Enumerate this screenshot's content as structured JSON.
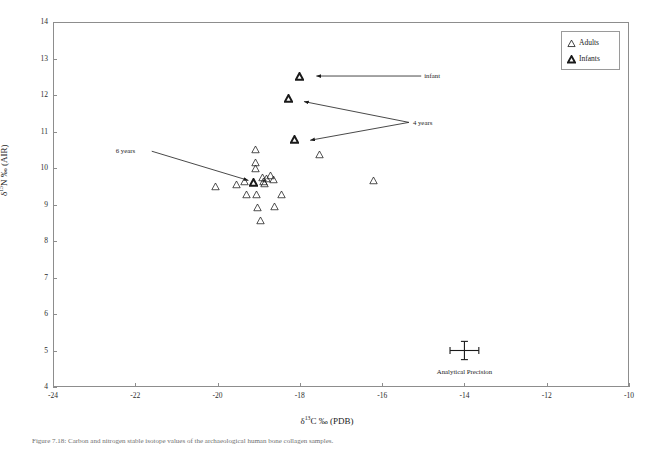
{
  "figure": {
    "caption": "Figure 7.18:  Carbon and nitrogen stable isotope values of the archaeological human bone collagen samples."
  },
  "legend": {
    "position": "top-right",
    "items": [
      {
        "label": "Adults",
        "marker": "open-triangle"
      },
      {
        "label": "Infants",
        "marker": "bold-triangle"
      }
    ]
  },
  "annotations": [
    {
      "id": "infant",
      "label": "infant"
    },
    {
      "id": "four-years",
      "label": "4 years"
    },
    {
      "id": "six-years",
      "label": "6 years"
    },
    {
      "id": "analytical-precision",
      "label": "Analytical Precision"
    }
  ],
  "chart_data": {
    "type": "scatter",
    "title": "",
    "xlabel": "δ¹³C ‰ (PDB)",
    "ylabel": "δ¹⁵N ‰ (AIR)",
    "xlim": [
      -24,
      -10
    ],
    "ylim": [
      4,
      14
    ],
    "xticks": [
      -24,
      -22,
      -20,
      -18,
      -16,
      -14,
      -12,
      -10
    ],
    "yticks": [
      4,
      5,
      6,
      7,
      8,
      9,
      10,
      11,
      12,
      13,
      14
    ],
    "grid": false,
    "series": [
      {
        "name": "Adults",
        "marker": "open-triangle",
        "points": [
          [
            -20.05,
            9.5
          ],
          [
            -19.55,
            9.55
          ],
          [
            -19.3,
            9.28
          ],
          [
            -19.08,
            10.52
          ],
          [
            -19.08,
            10.15
          ],
          [
            -19.08,
            9.98
          ],
          [
            -19.05,
            9.28
          ],
          [
            -19.02,
            8.92
          ],
          [
            -18.95,
            8.55
          ],
          [
            -18.92,
            9.75
          ],
          [
            -18.88,
            9.62
          ],
          [
            -18.85,
            9.58
          ],
          [
            -18.8,
            9.72
          ],
          [
            -18.72,
            9.8
          ],
          [
            -18.65,
            9.68
          ],
          [
            -18.62,
            8.95
          ],
          [
            -18.45,
            9.27
          ],
          [
            -17.52,
            10.38
          ],
          [
            -16.22,
            9.65
          ],
          [
            -19.35,
            9.62
          ]
        ]
      },
      {
        "name": "Infants",
        "marker": "bold-triangle",
        "points": [
          [
            -18.0,
            12.52
          ],
          [
            -18.28,
            11.9
          ],
          [
            -18.12,
            10.78
          ],
          [
            -19.12,
            9.6
          ]
        ]
      }
    ],
    "error_bar": {
      "label": "Analytical Precision",
      "x": -14.0,
      "y": 5.0,
      "x_error": 0.35,
      "y_error": 0.25
    },
    "callouts": [
      {
        "label": "infant",
        "text_x": -15.05,
        "text_y": 12.52,
        "target_x": -17.6,
        "target_y": 12.52
      },
      {
        "label": "4 years",
        "text_x": -15.35,
        "text_y": 11.25,
        "target_x": -17.9,
        "target_y": 11.82
      },
      {
        "label": "4 years",
        "text_x": -15.35,
        "text_y": 11.25,
        "target_x": -17.75,
        "target_y": 10.76
      },
      {
        "label": "6 years",
        "text_x": -21.6,
        "text_y": 10.46,
        "target_x": -19.25,
        "target_y": 9.66
      }
    ]
  }
}
